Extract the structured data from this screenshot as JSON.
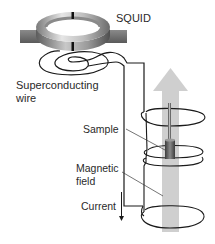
{
  "diagram": {
    "labels": {
      "squid": "SQUID",
      "superconducting_line1": "Superconducting",
      "superconducting_line2": "wire",
      "sample": "Sample",
      "magnetic_line1": "Magnetic",
      "magnetic_line2": "field",
      "current": "Current"
    },
    "components": [
      {
        "id": "squid-ring",
        "description": "Superconducting ring with two Josephson junctions"
      },
      {
        "id": "input-coil",
        "description": "Spiral coil under SQUID"
      },
      {
        "id": "pickup-coils",
        "description": "Gradiometer pickup loops around sample"
      },
      {
        "id": "sample",
        "description": "Sample on rod inside coils"
      },
      {
        "id": "field-arrow",
        "description": "Upward magnetic field arrow"
      },
      {
        "id": "current-arrow",
        "description": "Downward current direction arrow"
      }
    ],
    "colors": {
      "line": "#1a1a1a",
      "ring_light": "#d9d9d9",
      "ring_dark": "#6e6e6e",
      "field_arrow": "#c9c9c9",
      "sample": "#555555",
      "text": "#2a2a2a"
    }
  }
}
